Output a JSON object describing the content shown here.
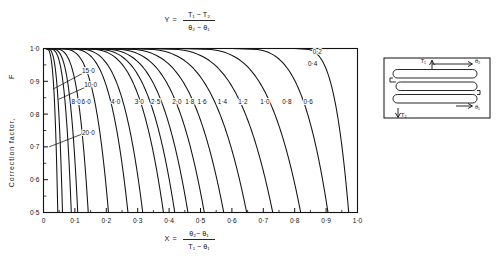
{
  "figure": {
    "title_formula": {
      "lhs": "Y",
      "eq": "=",
      "num": "T₁ − T₂",
      "den": "θ₂ − θ₁"
    },
    "xaxis_formula": {
      "lhs": "X",
      "eq": "=",
      "num": "θ₂− θ₁",
      "den": "T₁ − θ₁"
    },
    "ylabel": "Correction factor,",
    "ylabel_symbol": "F"
  },
  "inset": {
    "name": "heat-exchanger-schematic",
    "labels": {
      "hot_in": "T₁",
      "hot_out": "T₂",
      "cold_out": "θ₂",
      "cold_in": "θ₁"
    }
  },
  "chart_data": {
    "type": "line",
    "xlabel": "X = (theta2 - theta1) / (T1 - theta1)",
    "ylabel": "Correction factor, F",
    "xlim": [
      0,
      1.0
    ],
    "ylim": [
      0.5,
      1.0
    ],
    "grid": false,
    "legend_position": "inline-curve-labels",
    "xticks": [
      0,
      0.1,
      0.2,
      0.3,
      0.4,
      0.5,
      0.6,
      0.7,
      0.8,
      0.9,
      1.0
    ],
    "xticklabels": [
      "0",
      "0·1",
      "0·2",
      "0·3",
      "0·4",
      "0·5",
      "0·6",
      "0·7",
      "0·8",
      "0·9",
      "1·0"
    ],
    "xminorticks": [
      0.05,
      0.15,
      0.25,
      0.35,
      0.45,
      0.55,
      0.65,
      0.75,
      0.85,
      0.95
    ],
    "yticks": [
      0.5,
      0.6,
      0.7,
      0.8,
      0.9,
      1.0
    ],
    "yticklabels": [
      "0·5",
      "0·6",
      "0·7",
      "0·8",
      "0·9",
      "1·0"
    ],
    "yminorticks": [
      0.55,
      0.65,
      0.75,
      0.85,
      0.95
    ],
    "series": [
      {
        "name": "20·0",
        "value": 20.0,
        "x_asymptote": 0.0455,
        "x_at_F1": 0.004,
        "label_pos": [
          0.143,
          0.742
        ],
        "leader": [
          [
            0.136,
            0.744
          ],
          [
            0.018,
            0.7
          ]
        ]
      },
      {
        "name": "15·0",
        "value": 15.0,
        "x_asymptote": 0.0605,
        "x_at_F1": 0.006,
        "label_pos": [
          0.143,
          0.933
        ],
        "leader": [
          [
            0.136,
            0.93
          ],
          [
            0.03,
            0.876
          ]
        ]
      },
      {
        "name": "10·0",
        "value": 10.0,
        "x_asymptote": 0.0885,
        "x_at_F1": 0.01,
        "label_pos": [
          0.15,
          0.89
        ],
        "leader": [
          [
            0.143,
            0.886
          ],
          [
            0.048,
            0.845
          ]
        ]
      },
      {
        "name": "8·0",
        "value": 8.0,
        "x_asymptote": 0.109,
        "x_at_F1": 0.014,
        "label_pos": [
          0.104,
          0.837
        ],
        "leader": null
      },
      {
        "name": "6·0",
        "value": 6.0,
        "x_asymptote": 0.1425,
        "x_at_F1": 0.02,
        "label_pos": [
          0.136,
          0.837
        ],
        "leader": null
      },
      {
        "name": "4·0",
        "value": 4.0,
        "x_asymptote": 0.207,
        "x_at_F1": 0.035,
        "label_pos": [
          0.23,
          0.837
        ],
        "leader": null
      },
      {
        "name": "3·0",
        "value": 3.0,
        "x_asymptote": 0.269,
        "x_at_F1": 0.053,
        "label_pos": [
          0.305,
          0.837
        ],
        "leader": null
      },
      {
        "name": "2·5",
        "value": 2.5,
        "x_asymptote": 0.316,
        "x_at_F1": 0.068,
        "label_pos": [
          0.357,
          0.837
        ],
        "leader": null
      },
      {
        "name": "2·0",
        "value": 2.0,
        "x_asymptote": 0.382,
        "x_at_F1": 0.093,
        "label_pos": [
          0.425,
          0.837
        ],
        "leader": null
      },
      {
        "name": "1·8",
        "value": 1.8,
        "x_asymptote": 0.418,
        "x_at_F1": 0.108,
        "label_pos": [
          0.466,
          0.837
        ],
        "leader": null
      },
      {
        "name": "1·6",
        "value": 1.6,
        "x_asymptote": 0.46,
        "x_at_F1": 0.128,
        "label_pos": [
          0.505,
          0.837
        ],
        "leader": null
      },
      {
        "name": "1·4",
        "value": 1.4,
        "x_asymptote": 0.512,
        "x_at_F1": 0.155,
        "label_pos": [
          0.57,
          0.837
        ],
        "leader": null
      },
      {
        "name": "1·2",
        "value": 1.2,
        "x_asymptote": 0.574,
        "x_at_F1": 0.192,
        "label_pos": [
          0.635,
          0.837
        ],
        "leader": null
      },
      {
        "name": "1·0",
        "value": 1.0,
        "x_asymptote": 0.647,
        "x_at_F1": 0.245,
        "label_pos": [
          0.705,
          0.837
        ],
        "leader": null
      },
      {
        "name": "0·8",
        "value": 0.8,
        "x_asymptote": 0.73,
        "x_at_F1": 0.32,
        "label_pos": [
          0.775,
          0.837
        ],
        "leader": null
      },
      {
        "name": "0·6",
        "value": 0.6,
        "x_asymptote": 0.819,
        "x_at_F1": 0.43,
        "label_pos": [
          0.843,
          0.837
        ],
        "leader": null
      },
      {
        "name": "0·4",
        "value": 0.4,
        "x_asymptote": 0.906,
        "x_at_F1": 0.6,
        "label_pos": [
          0.857,
          0.955
        ],
        "leader": null
      },
      {
        "name": "0·2",
        "value": 0.2,
        "x_asymptote": 0.972,
        "x_at_F1": 0.8,
        "label_pos": [
          0.872,
          0.99
        ],
        "leader": null
      }
    ]
  }
}
